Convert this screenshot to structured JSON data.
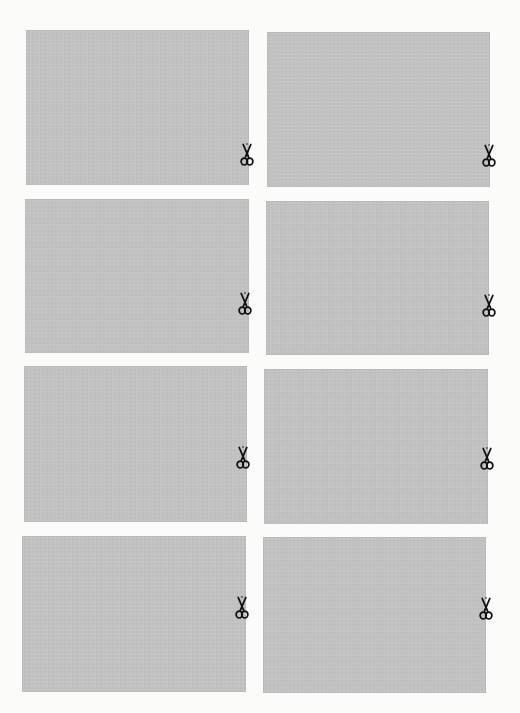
{
  "page": {
    "background": "#fbfbfa",
    "card_color": "#c2c2c2",
    "icon_color": "#111111"
  },
  "cards": [
    {
      "id": "r1-left",
      "row": 1,
      "column": "left",
      "x": 26,
      "y": 30,
      "w": 223,
      "h": 155,
      "cut_icon": "scissors-icon",
      "cut_x": 247,
      "cut_y": 155
    },
    {
      "id": "r1-right",
      "row": 1,
      "column": "right",
      "x": 267,
      "y": 32,
      "w": 223,
      "h": 155,
      "cut_icon": "scissors-icon",
      "cut_x": 489,
      "cut_y": 156
    },
    {
      "id": "r2-left",
      "row": 2,
      "column": "left",
      "x": 25,
      "y": 199,
      "w": 224,
      "h": 154,
      "cut_icon": "scissors-icon",
      "cut_x": 245,
      "cut_y": 304
    },
    {
      "id": "r2-right",
      "row": 2,
      "column": "right",
      "x": 266,
      "y": 201,
      "w": 223,
      "h": 154,
      "cut_icon": "scissors-icon",
      "cut_x": 489,
      "cut_y": 306
    },
    {
      "id": "r3-left",
      "row": 3,
      "column": "left",
      "x": 24,
      "y": 366,
      "w": 223,
      "h": 156,
      "cut_icon": "scissors-icon",
      "cut_x": 243,
      "cut_y": 458
    },
    {
      "id": "r3-right",
      "row": 3,
      "column": "right",
      "x": 264,
      "y": 369,
      "w": 224,
      "h": 155,
      "cut_icon": "scissors-icon",
      "cut_x": 487,
      "cut_y": 459
    },
    {
      "id": "r4-left",
      "row": 4,
      "column": "left",
      "x": 22,
      "y": 536,
      "w": 224,
      "h": 156,
      "cut_icon": "scissors-icon",
      "cut_x": 242,
      "cut_y": 608
    },
    {
      "id": "r4-right",
      "row": 4,
      "column": "right",
      "x": 263,
      "y": 537,
      "w": 223,
      "h": 156,
      "cut_icon": "scissors-icon",
      "cut_x": 486,
      "cut_y": 609
    }
  ]
}
